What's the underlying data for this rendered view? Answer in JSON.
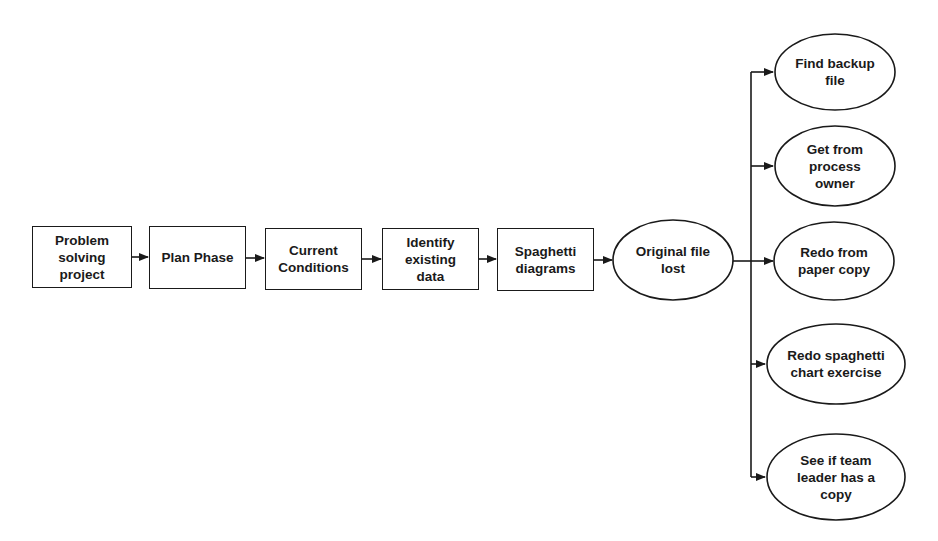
{
  "diagram": {
    "type": "flowchart",
    "process_steps": [
      {
        "id": "step1",
        "label": "Problem\nsolving\nproject",
        "shape": "rectangle"
      },
      {
        "id": "step2",
        "label": "Plan Phase",
        "shape": "rectangle"
      },
      {
        "id": "step3",
        "label": "Current\nConditions",
        "shape": "rectangle"
      },
      {
        "id": "step4",
        "label": "Identify\nexisting\ndata",
        "shape": "rectangle"
      },
      {
        "id": "step5",
        "label": "Spaghetti\ndiagrams",
        "shape": "rectangle"
      }
    ],
    "problem": {
      "id": "problem",
      "label": "Original file\nlost",
      "shape": "ellipse"
    },
    "options": [
      {
        "id": "opt1",
        "label": "Find backup\nfile",
        "shape": "ellipse"
      },
      {
        "id": "opt2",
        "label": "Get from\nprocess\nowner",
        "shape": "ellipse"
      },
      {
        "id": "opt3",
        "label": "Redo from\npaper copy",
        "shape": "ellipse"
      },
      {
        "id": "opt4",
        "label": "Redo spaghetti\nchart exercise",
        "shape": "ellipse"
      },
      {
        "id": "opt5",
        "label": "See if team\nleader has a\ncopy",
        "shape": "ellipse"
      }
    ],
    "edges": [
      {
        "from": "step1",
        "to": "step2"
      },
      {
        "from": "step2",
        "to": "step3"
      },
      {
        "from": "step3",
        "to": "step4"
      },
      {
        "from": "step4",
        "to": "step5"
      },
      {
        "from": "step5",
        "to": "problem"
      },
      {
        "from": "problem",
        "to": "opt1"
      },
      {
        "from": "problem",
        "to": "opt2"
      },
      {
        "from": "problem",
        "to": "opt3"
      },
      {
        "from": "problem",
        "to": "opt4"
      },
      {
        "from": "problem",
        "to": "opt5"
      }
    ],
    "colors": {
      "stroke": "#1a1a1a",
      "fill": "#ffffff",
      "text": "#1a1a1a"
    }
  }
}
